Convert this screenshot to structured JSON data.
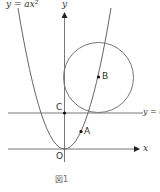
{
  "diagram": {
    "title": "図1",
    "labels": {
      "parabola": "y = ax²",
      "y_axis": "y",
      "x_axis": "x",
      "line": "y = 6",
      "origin": "O",
      "point_c": "C",
      "point_a": "A",
      "point_b": "B"
    },
    "colors": {
      "stroke": "#666666",
      "point": "#111111",
      "text": "#333333"
    },
    "elements": [
      {
        "type": "parabola",
        "equation": "y = ax^2",
        "vertex": "O"
      },
      {
        "type": "line",
        "equation": "y = 6"
      },
      {
        "type": "circle",
        "center": "B",
        "tangent_to": [
          "y-axis",
          "y = 6"
        ]
      },
      {
        "type": "point",
        "name": "A",
        "on": "parabola"
      },
      {
        "type": "point",
        "name": "B",
        "role": "circle center, on parabola"
      },
      {
        "type": "point",
        "name": "C",
        "role": "intersection of y-axis and y = 6"
      }
    ]
  }
}
